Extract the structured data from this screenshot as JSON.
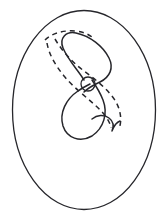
{
  "figure": {
    "title": "Figure-eight curve inside an oval region with dashed deformed copy",
    "domain_kind": "mathematical line diagram",
    "background_color": "#ffffff",
    "ink_color": "#26262b",
    "canvas": {
      "width": 166,
      "height": 214
    },
    "elements": {
      "outer_oval": {
        "name": "outer-oval-boundary",
        "style": "solid",
        "stroke_width": 1.3,
        "center_x": 84,
        "center_y": 110,
        "radius_x": 72,
        "radius_y": 100,
        "description": "Large solid closed oval enclosing the whole construction"
      },
      "upper_loop": {
        "name": "figure-eight-upper-loop",
        "style": "solid",
        "stroke_width": 1.5,
        "description": "Solid teardrop-shaped upper lobe of the figure eight, apex near top-left at (63,38), widest near (108,58)"
      },
      "lower_loop": {
        "name": "figure-eight-lower-loop",
        "style": "solid",
        "stroke_width": 1.5,
        "description": "Solid rounded lower lobe of the figure eight, bottom near (84,137)"
      },
      "crossing_node": {
        "name": "self-intersection-node",
        "style": "solid",
        "stroke_width": 1.3,
        "center_x": 88,
        "center_y": 84,
        "radius": 7,
        "description": "Small circle marking the self-crossing point of the figure eight"
      },
      "dashed_outer_arc": {
        "name": "dashed-deformation-outer-arc",
        "style": "dashed",
        "stroke_width": 1.5,
        "dash_pattern": "5 4",
        "description": "Long dashed arc sweeping from upper-left through right side down to a hook near (118,128)"
      },
      "dashed_inner_arc": {
        "name": "dashed-deformation-inner-arc",
        "style": "dashed",
        "stroke_width": 1.5,
        "dash_pattern": "5 4",
        "description": "Second dashed arc running parallel inside the outer dashed arc"
      },
      "dashed_top_arc": {
        "name": "dashed-top-cap-arc",
        "style": "dashed",
        "stroke_width": 1.5,
        "dash_pattern": "5 4",
        "description": "Short dashed arc capping the top of the upper loop from (46,39) to (88,36)"
      },
      "hook_tail": {
        "name": "dashed-arc-hook-tail",
        "style": "solid",
        "stroke_width": 1.5,
        "description": "Small V-shaped hook terminating the dashed arcs near (112,128)"
      }
    },
    "labels": [],
    "legend": [],
    "annotations": []
  }
}
